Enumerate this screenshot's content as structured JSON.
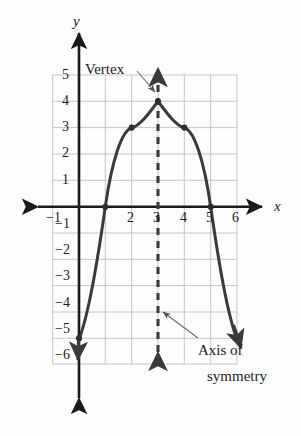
{
  "figure": {
    "kind": "cartesian-parabola-graph",
    "axis_labels": {
      "x": "x",
      "y": "y"
    },
    "annotations": {
      "vertex_label": "Vertex",
      "axis_of_symmetry_line1": "Axis of",
      "axis_of_symmetry_line2": "symmetry"
    },
    "colors": {
      "curve": "#3a3a3a",
      "axis": "#1a1a1a",
      "grid": "#b9b9c4",
      "dashed": "#3a3a3a",
      "text": "#1c1c1c",
      "background": "#fdfdfd"
    }
  },
  "chart_data": {
    "type": "line",
    "title": "",
    "subtitle": "",
    "xlabel": "x",
    "ylabel": "y",
    "xlim": [
      -1,
      6
    ],
    "ylim": [
      -6,
      5
    ],
    "grid": true,
    "legend": "none",
    "equation": "y = -(x - 1)(x - 5)",
    "x_ticks": [
      -1,
      1,
      2,
      3,
      4,
      5,
      6
    ],
    "x_tick_labels": [
      "-1",
      "",
      "2",
      "3",
      "4",
      "5",
      "6"
    ],
    "y_ticks": [
      5,
      4,
      3,
      2,
      1,
      -1,
      -2,
      -3,
      -4,
      -5,
      -6
    ],
    "y_tick_labels": [
      "5",
      "4",
      "3",
      "2",
      "1",
      "-1",
      "-2",
      "-3",
      "-4",
      "-5",
      "-6"
    ],
    "series": [
      {
        "name": "parabola",
        "x": [
          -0.02,
          0.25,
          0.5,
          0.75,
          1,
          1.5,
          2,
          2.5,
          3,
          3.5,
          4,
          4.5,
          5,
          5.5,
          6,
          6.1
        ],
        "values": [
          -5.12,
          -3.81,
          -2.75,
          -1.81,
          0,
          1.75,
          3,
          3.75,
          4,
          3.75,
          3,
          1.75,
          0,
          -1.25,
          -5,
          -5.71
        ]
      }
    ],
    "marked_points": [
      {
        "label": "y-intercept",
        "x": 0,
        "y": -5
      },
      {
        "label": "x-intercept",
        "x": 1,
        "y": 0
      },
      {
        "label": "point",
        "x": 2,
        "y": 3
      },
      {
        "label": "vertex",
        "x": 3,
        "y": 4
      },
      {
        "label": "point",
        "x": 4,
        "y": 3
      },
      {
        "label": "x-intercept",
        "x": 5,
        "y": 0
      }
    ],
    "annotations": [
      {
        "text": "Vertex",
        "points_to_x": 3,
        "points_to_y": 4
      },
      {
        "text": "Axis of symmetry",
        "points_to_x": 3,
        "points_to_y": -5.2
      }
    ],
    "axis_of_symmetry": {
      "x": 3,
      "style": "dashed",
      "from_y": -6,
      "to_y": 5,
      "arrows": "both"
    }
  },
  "ticks": {
    "x": [
      {
        "name": "x-tick--1",
        "text": "-1",
        "left": 46,
        "top": 211
      },
      {
        "name": "x-tick-2",
        "text": "2",
        "left": 127,
        "top": 211
      },
      {
        "name": "x-tick-3",
        "text": "3",
        "left": 153,
        "top": 211
      },
      {
        "name": "x-tick-4",
        "text": "4",
        "left": 180,
        "top": 211
      },
      {
        "name": "x-tick-5",
        "text": "5",
        "left": 206,
        "top": 211
      },
      {
        "name": "x-tick-6",
        "text": "6",
        "left": 232,
        "top": 211
      }
    ],
    "y": [
      {
        "name": "y-tick-5",
        "text": "5",
        "left": 62,
        "top": 68
      },
      {
        "name": "y-tick-4",
        "text": "4",
        "left": 62,
        "top": 94
      },
      {
        "name": "y-tick-3",
        "text": "3",
        "left": 62,
        "top": 120
      },
      {
        "name": "y-tick-2",
        "text": "2",
        "left": 62,
        "top": 146
      },
      {
        "name": "y-tick-1",
        "text": "1",
        "left": 62,
        "top": 173
      },
      {
        "name": "y-tick--1",
        "text": "-1",
        "left": 55,
        "top": 217
      },
      {
        "name": "y-tick--2",
        "text": "-2",
        "left": 55,
        "top": 243
      },
      {
        "name": "y-tick--3",
        "text": "-3",
        "left": 55,
        "top": 269
      },
      {
        "name": "y-tick--4",
        "text": "-4",
        "left": 55,
        "top": 296
      },
      {
        "name": "y-tick--5",
        "text": "-5",
        "left": 55,
        "top": 322
      },
      {
        "name": "y-tick--6",
        "text": "-6",
        "left": 55,
        "top": 348
      }
    ]
  }
}
